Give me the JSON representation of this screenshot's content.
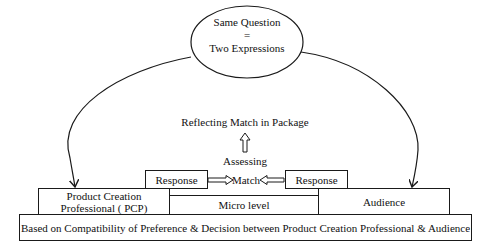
{
  "diagram": {
    "ellipse": {
      "line1": "Same Question",
      "line2": "=",
      "line3": "Two Expressions"
    },
    "reflecting_label": "Reflecting Match in Package",
    "assessing_label": "Assessing",
    "match_label": "Match",
    "response_left": "Response",
    "response_right": "Response",
    "pcp_box": {
      "line1": "Product Creation",
      "line2": "Professional ( PCP)"
    },
    "micro_level": "Micro level",
    "audience": "Audience",
    "base_box": "Based on Compatibility of Preference & Decision between Product Creation Professional & Audience"
  }
}
